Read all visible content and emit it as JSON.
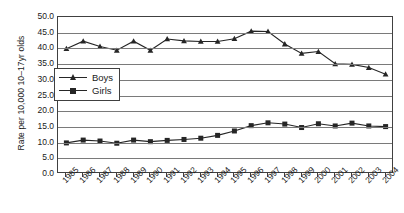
{
  "chart_data": {
    "type": "line",
    "title": "",
    "xlabel": "",
    "ylabel": "Rate per 10,000 10–17yr olds",
    "categories": [
      "1985",
      "1986",
      "1987",
      "1988",
      "1989",
      "1990",
      "1991",
      "1992",
      "1993",
      "1994",
      "1995",
      "1996",
      "1997",
      "1998",
      "1999",
      "2000",
      "2001",
      "2002",
      "2003",
      "2004"
    ],
    "ylim": [
      0,
      50
    ],
    "ytick_labels": [
      "50.0",
      "45.0",
      "40.0",
      "35.0",
      "30.0",
      "25.0",
      "20.0",
      "15.0",
      "10.0",
      "5.0",
      "0.0"
    ],
    "ytick_values": [
      50,
      45,
      40,
      35,
      30,
      25,
      20,
      15,
      10,
      5,
      0
    ],
    "ytick_step": 5,
    "grid": true,
    "legend_position": "inside-upper-left",
    "series": [
      {
        "name": "Boys",
        "marker": "triangle",
        "color": "#262626",
        "values": [
          39.9,
          42.3,
          40.6,
          39.4,
          42.3,
          39.4,
          43.0,
          42.4,
          42.2,
          42.2,
          43.1,
          45.5,
          45.4,
          41.4,
          38.4,
          39.0,
          35.1,
          34.9,
          33.9,
          31.8
        ]
      },
      {
        "name": "Girls",
        "marker": "square",
        "color": "#262626",
        "values": [
          9.9,
          10.8,
          10.5,
          9.8,
          10.8,
          10.3,
          10.7,
          11.0,
          11.4,
          12.3,
          13.7,
          15.4,
          16.3,
          15.9,
          14.8,
          16.0,
          15.3,
          16.2,
          15.3,
          15.1
        ]
      }
    ]
  },
  "axis": {
    "y_title": "Rate per 10,000 10–17yr olds"
  },
  "legend": {
    "items": [
      {
        "label": "Boys",
        "marker": "triangle-marker-icon"
      },
      {
        "label": "Girls",
        "marker": "square-marker-icon"
      }
    ]
  },
  "caption": {
    "text": ""
  }
}
